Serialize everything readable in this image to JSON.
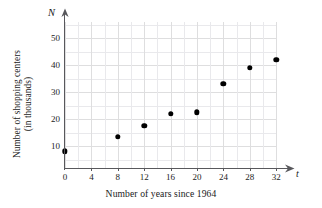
{
  "chart_data": {
    "type": "scatter",
    "title": "",
    "xlabel": "Number of years since 1964",
    "ylabel_line1": "Number of shopping centers",
    "ylabel_line2": "(in thousands)",
    "x_variable": "t",
    "y_variable": "N",
    "xlim": [
      0,
      34
    ],
    "ylim": [
      0,
      56
    ],
    "x_ticks": [
      0,
      4,
      8,
      12,
      16,
      20,
      24,
      28,
      32
    ],
    "x_tick_labels": [
      "0",
      "4",
      "8",
      "12",
      "16",
      "20",
      "24",
      "28",
      "32"
    ],
    "y_ticks": [
      10,
      20,
      30,
      40,
      50
    ],
    "y_tick_labels": [
      "10",
      "20",
      "30",
      "40",
      "50"
    ],
    "grid": true,
    "grid_color": "#e9e9ec",
    "legend": "none",
    "point_color": "#000000",
    "axis_color": "#58585c",
    "x": [
      0,
      8,
      12,
      16,
      20,
      24,
      28,
      32
    ],
    "values": [
      8,
      13.5,
      17.5,
      22,
      22.5,
      33,
      39,
      42
    ],
    "points": [
      {
        "t": 0,
        "N": 8
      },
      {
        "t": 8,
        "N": 13.5
      },
      {
        "t": 12,
        "N": 17.5
      },
      {
        "t": 16,
        "N": 22
      },
      {
        "t": 20,
        "N": 22.5
      },
      {
        "t": 24,
        "N": 33
      },
      {
        "t": 28,
        "N": 39
      },
      {
        "t": 32,
        "N": 42
      }
    ]
  }
}
